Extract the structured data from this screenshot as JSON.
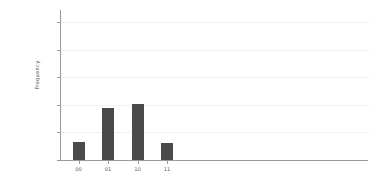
{
  "chart_data": {
    "type": "bar",
    "title": "",
    "xlabel": "",
    "ylabel": "Frequency",
    "categories": [
      "00",
      "01",
      "10",
      "11"
    ],
    "values": [
      128,
      375,
      405,
      124
    ],
    "series": [
      {
        "name": "Frequency",
        "values": [
          128,
          375,
          405,
          124
        ]
      }
    ],
    "ylim": [
      0,
      1080
    ],
    "yticks": [
      0,
      200,
      400,
      600,
      800,
      1000
    ],
    "ytick_labels": [
      "0",
      "200",
      "400",
      "600",
      "800",
      "1000"
    ],
    "xtick_labels": [
      "00",
      "01",
      "10",
      "11"
    ],
    "grid": true,
    "grid_axis": "y",
    "legend": false,
    "legend_position": "none",
    "bar_color": "#4a4a4a",
    "grid_color": "#f2f2f2",
    "axis_color": "#9a9a9a",
    "text_color": "#5a5a5a",
    "background": "#ffffff"
  }
}
